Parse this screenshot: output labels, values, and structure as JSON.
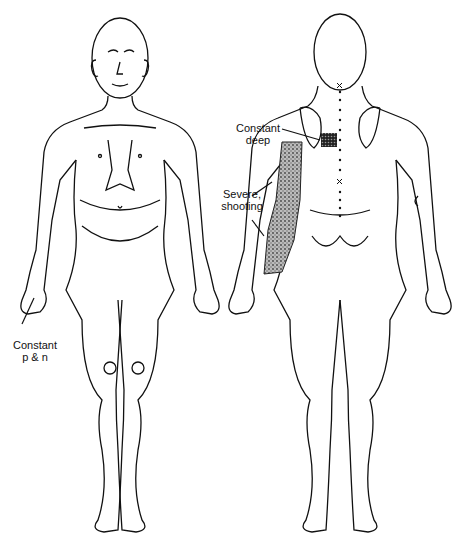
{
  "figure": {
    "views": [
      "anterior",
      "posterior"
    ],
    "annotations": [
      {
        "id": "constant-pn",
        "line1": "Constant",
        "line2": "p & n",
        "view": "anterior",
        "location": "right hand / fingers"
      },
      {
        "id": "constant-deep",
        "line1": "Constant",
        "line2": "deep",
        "view": "posterior",
        "location": "medial scapular border"
      },
      {
        "id": "severe-shooting",
        "line1": "Severe,",
        "line2": "shooting",
        "view": "posterior",
        "location": "posterior arm and forearm"
      }
    ],
    "spine_markers": {
      "dots": "dotted line along spine",
      "x_marks": 2
    }
  }
}
